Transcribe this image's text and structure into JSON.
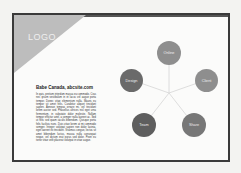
{
  "logo": {
    "text": "LOGO",
    "color": "#bdbdbd"
  },
  "site": {
    "title": "Babe Canada, abcsite.com"
  },
  "body": {
    "text": "In quis, pretium interdum massa eu commodo. Cras nec ipsum vestibulum in et lacus vel augue porta tempor. Donec vitae elementum nulla. Mauris eu tempor sit amet felis. Curabitur aliquet tincidunt sapien. Aenean tempus ornare mi, vel tincidunt lorem auctor sed. Phasellus ultrices nisl eget urna fermentum, in vulputate dolor molestie. Nullam tempor efficitur ante, a semper nulla laoreet ac. Sed ut felis sed quam iaculis bibendum. Quisque porta felis facilisis nunc. Duis vitae lorem at mi commodo semper. Integer volutpat sapien non dolor lacinia, eget laoreet ex tincidunt. Vivamus congue, lectus sit amet bibendum luctus, massa nulla consequat neque, vel dictum erat purus sed dolor. Proin eu tortor vitae velit placerat volutpat in vitae augue."
  },
  "diagram": {
    "center_color": "#c9c9c9",
    "nodes": [
      {
        "label": "Online",
        "color": "#8e8e8e"
      },
      {
        "label": "Client",
        "color": "#8e8e8e"
      },
      {
        "label": "Share",
        "color": "#777777"
      },
      {
        "label": "Team",
        "color": "#5e5e5e"
      },
      {
        "label": "Design",
        "color": "#6a6a6a"
      }
    ]
  }
}
